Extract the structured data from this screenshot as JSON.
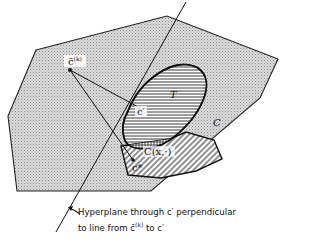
{
  "diagram": {
    "regions": {
      "outer_set": {
        "label": "C",
        "fill": "stippled gray"
      },
      "set_T": {
        "label": "T",
        "fill": "horizontal hatching"
      },
      "cone": {
        "label": "C(x,·)",
        "fill": "diagonal hatching"
      },
      "intersection": {
        "fill": "cross hatching"
      }
    },
    "points": {
      "c_bar_k": {
        "label": "c̄",
        "superscript": "(k)"
      },
      "c_prime": {
        "label": "c′"
      },
      "c_star": {
        "label": "c*"
      }
    },
    "annotation": {
      "line1": "Hyperplane through c′ perpendicular",
      "line2_prefix": "to line from ",
      "line2_symbol": "c̄",
      "line2_sup": "(k)",
      "line2_suffix": " to c′"
    }
  }
}
